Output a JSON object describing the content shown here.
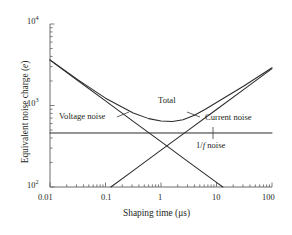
{
  "chart_data": {
    "type": "line",
    "title": "",
    "xlabel": "Shaping time (μs)",
    "ylabel": "Equivalent noise charge (e)",
    "xscale": "log",
    "yscale": "log",
    "xlim": [
      0.01,
      100
    ],
    "ylim": [
      100,
      10000
    ],
    "grid": false,
    "legend_position": "inline-annotations",
    "xticks": [
      {
        "value": 0.01,
        "label": "0.01"
      },
      {
        "value": 0.1,
        "label": "0.1"
      },
      {
        "value": 1,
        "label": "1"
      },
      {
        "value": 10,
        "label": "10"
      },
      {
        "value": 100,
        "label": "100"
      }
    ],
    "yticks": [
      {
        "value": 100,
        "mantissa": "10",
        "exponent": "2"
      },
      {
        "value": 1000,
        "mantissa": "10",
        "exponent": "3"
      },
      {
        "value": 10000,
        "mantissa": "10",
        "exponent": "4"
      }
    ],
    "series": [
      {
        "name": "Voltage noise",
        "slope": -0.5,
        "points": [
          {
            "x": 0.01,
            "y": 3600
          },
          {
            "x": 0.0316,
            "y": 2025
          },
          {
            "x": 0.1,
            "y": 1139
          },
          {
            "x": 0.316,
            "y": 640
          },
          {
            "x": 1,
            "y": 360
          },
          {
            "x": 3.16,
            "y": 202
          },
          {
            "x": 10,
            "y": 114
          },
          {
            "x": 13.0,
            "y": 100
          }
        ]
      },
      {
        "name": "Current noise",
        "slope": 0.5,
        "points": [
          {
            "x": 0.125,
            "y": 100
          },
          {
            "x": 0.316,
            "y": 159
          },
          {
            "x": 1,
            "y": 283
          },
          {
            "x": 3.16,
            "y": 503
          },
          {
            "x": 10,
            "y": 894
          },
          {
            "x": 31.6,
            "y": 1590
          },
          {
            "x": 100,
            "y": 2830
          }
        ]
      },
      {
        "name": "1/f noise",
        "slope": 0,
        "points": [
          {
            "x": 0.01,
            "y": 460
          },
          {
            "x": 100,
            "y": 460
          }
        ]
      },
      {
        "name": "Total",
        "points": [
          {
            "x": 0.01,
            "y": 3630
          },
          {
            "x": 0.0316,
            "y": 2075
          },
          {
            "x": 0.1,
            "y": 1230
          },
          {
            "x": 0.316,
            "y": 810
          },
          {
            "x": 0.6,
            "y": 690
          },
          {
            "x": 1,
            "y": 645
          },
          {
            "x": 1.6,
            "y": 635
          },
          {
            "x": 2.5,
            "y": 670
          },
          {
            "x": 4,
            "y": 760
          },
          {
            "x": 6.3,
            "y": 900
          },
          {
            "x": 10,
            "y": 1090
          },
          {
            "x": 31.6,
            "y": 1750
          },
          {
            "x": 100,
            "y": 2900
          }
        ]
      }
    ],
    "annotations": [
      {
        "name": "total-label",
        "text": "Total",
        "x_px": 158,
        "y_px": 100
      },
      {
        "name": "voltage-noise-label",
        "text": "Voltage noise",
        "x_px": 59,
        "y_px": 116
      },
      {
        "name": "current-noise-label",
        "text": "Current noise",
        "x_px": 205,
        "y_px": 118
      },
      {
        "name": "one-over-f-noise-label",
        "text_pre": "1/",
        "text_ital": "f",
        "text_post": " noise",
        "x_px": 196,
        "y_px": 145
      }
    ],
    "colors": {
      "axis": "#6d6d6d",
      "curve": "#2b2b2b",
      "background": "#ffffff",
      "text": "#231f20"
    }
  }
}
